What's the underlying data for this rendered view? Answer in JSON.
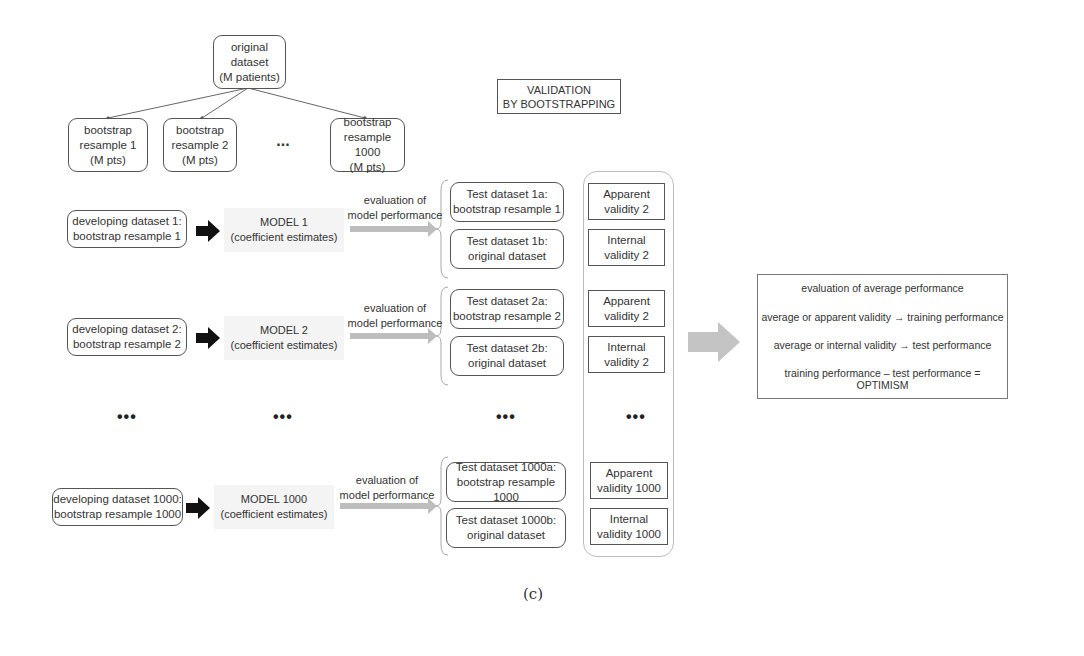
{
  "title_box": "VALIDATION\nBY BOOTSTRAPPING",
  "tree": {
    "root": "original\ndataset\n(M patients)",
    "children": [
      "bootstrap\nresample 1\n(M pts)",
      "bootstrap\nresample 2\n(M pts)",
      "bootstrap\nresample 1000\n(M pts)"
    ],
    "ellipsis": "..."
  },
  "rows": [
    {
      "developing": "developing dataset 1:\nbootstrap resample 1",
      "model": "MODEL 1\n(coefficient estimates)",
      "eval_label": "evaluation of\nmodel performance",
      "test_a": "Test dataset 1a:\nbootstrap resample 1",
      "test_b": "Test dataset 1b:\noriginal dataset",
      "apparent": "Apparent\nvalidity 2",
      "internal": "Internal\nvalidity 2"
    },
    {
      "developing": "developing dataset 2:\nbootstrap resample 2",
      "model": "MODEL 2\n(coefficient estimates)",
      "eval_label": "evaluation of\nmodel performance",
      "test_a": "Test dataset 2a:\nbootstrap resample 2",
      "test_b": "Test dataset 2b:\noriginal dataset",
      "apparent": "Apparent\nvalidity 2",
      "internal": "Internal\nvalidity 2"
    },
    {
      "developing": "developing dataset 1000:\nbootstrap resample 1000",
      "model": "MODEL 1000\n(coefficient estimates)",
      "eval_label": "evaluation of\nmodel performance",
      "test_a": "Test dataset 1000a:\nbootstrap resample 1000",
      "test_b": "Test dataset 1000b:\noriginal dataset",
      "apparent": "Apparent\nvalidity 1000",
      "internal": "Internal\nvalidity 1000"
    }
  ],
  "ellipsis_row": "•••",
  "summary": {
    "title": "evaluation of average performance",
    "line1": "average or apparent validity → training performance",
    "line2": "average or internal validity → test performance",
    "line3": "training performance – test performance = OPTIMISM"
  },
  "caption": "(c)"
}
